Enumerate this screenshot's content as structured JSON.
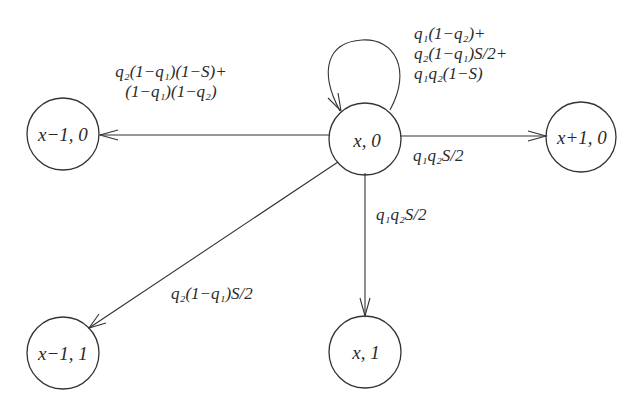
{
  "diagram": {
    "type": "state-transition",
    "nodes": [
      {
        "id": "x0",
        "label": "x, 0",
        "cx": 365,
        "cy": 139
      },
      {
        "id": "xm1_0",
        "label": "x−1, 0",
        "cx": 63,
        "cy": 134
      },
      {
        "id": "xp1_0",
        "label": "x+1, 0",
        "cx": 581,
        "cy": 137
      },
      {
        "id": "xm1_1",
        "label": "x−1, 1",
        "cx": 63,
        "cy": 353
      },
      {
        "id": "x1",
        "label": "x, 1",
        "cx": 365,
        "cy": 352
      }
    ],
    "edges": [
      {
        "from": "x0",
        "to": "x0",
        "label_lines": [
          "q₁(1−q₂)+",
          "q₂(1−q₁)S/2+",
          "q₁q₂(1−S)"
        ]
      },
      {
        "from": "x0",
        "to": "xm1_0",
        "label_lines": [
          "q₂(1−q₁)(1−S)+",
          "(1−q₁)(1−q₂)"
        ]
      },
      {
        "from": "x0",
        "to": "xp1_0",
        "label_lines": [
          "q₁q₂S/2"
        ]
      },
      {
        "from": "x0",
        "to": "x1",
        "label_lines": [
          "q₁q₂S/2"
        ]
      },
      {
        "from": "x0",
        "to": "xm1_1",
        "label_lines": [
          "q₂(1−q₁)S/2"
        ]
      }
    ]
  }
}
